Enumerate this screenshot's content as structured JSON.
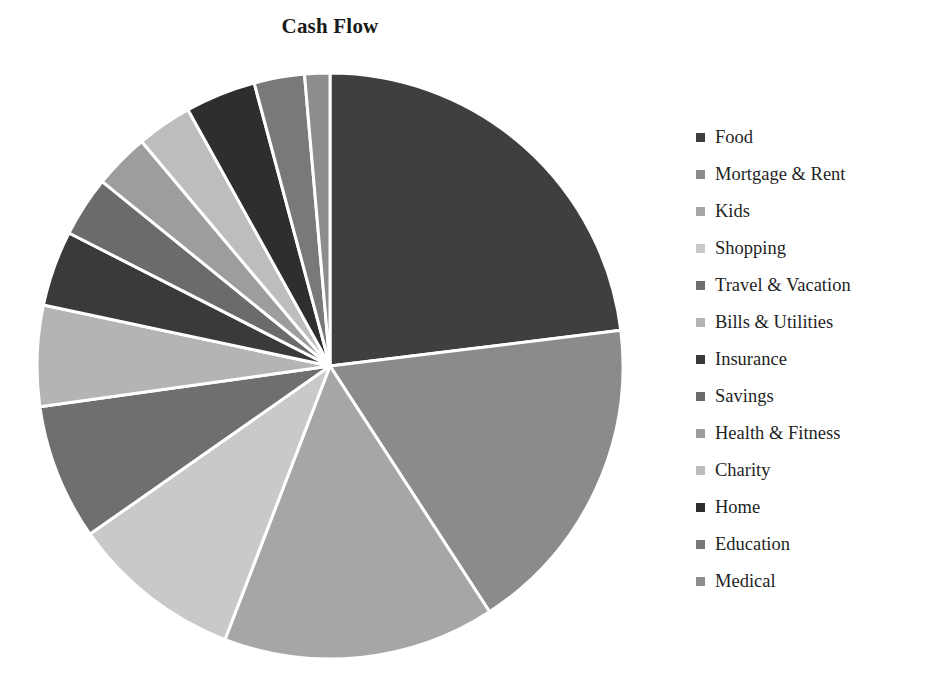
{
  "chart_data": {
    "type": "pie",
    "title": "Cash Flow",
    "xlabel": "",
    "ylabel": "",
    "legend_position": "right",
    "grid": false,
    "start_angle_deg": 0,
    "direction": "clockwise",
    "categories": [
      "Food",
      "Mortgage & Rent",
      "Kids",
      "Shopping",
      "Travel & Vacation",
      "Bills & Utilities",
      "Insurance",
      "Savings",
      "Health & Fitness",
      "Charity",
      "Home",
      "Education",
      "Medical"
    ],
    "values": [
      23.1,
      17.8,
      15.0,
      9.4,
      7.5,
      5.6,
      4.2,
      3.3,
      3.0,
      3.0,
      3.9,
      2.8,
      1.4
    ],
    "unit": "percent",
    "slice_colors": [
      "#3f3f3f",
      "#8b8b8b",
      "#a6a6a6",
      "#c9c9c9",
      "#6f6f6f",
      "#b4b4b4",
      "#3a3a3a",
      "#6b6b6b",
      "#9d9d9d",
      "#bdbdbd",
      "#2e2e2e",
      "#797979",
      "#8d8d8d"
    ],
    "slice_border_color": "#ffffff",
    "slices": [
      {
        "label": "Food",
        "value": 23.1,
        "color": "#3f3f3f",
        "start_deg": 0,
        "end_deg": 83
      },
      {
        "label": "Mortgage & Rent",
        "value": 17.8,
        "color": "#8b8b8b",
        "start_deg": 83,
        "end_deg": 147
      },
      {
        "label": "Kids",
        "value": 15.0,
        "color": "#a6a6a6",
        "start_deg": 147,
        "end_deg": 201
      },
      {
        "label": "Shopping",
        "value": 9.4,
        "color": "#c9c9c9",
        "start_deg": 201,
        "end_deg": 235
      },
      {
        "label": "Travel & Vacation",
        "value": 7.5,
        "color": "#6f6f6f",
        "start_deg": 235,
        "end_deg": 262
      },
      {
        "label": "Bills & Utilities",
        "value": 5.6,
        "color": "#b4b4b4",
        "start_deg": 262,
        "end_deg": 282
      },
      {
        "label": "Insurance",
        "value": 4.2,
        "color": "#3a3a3a",
        "start_deg": 282,
        "end_deg": 297
      },
      {
        "label": "Savings",
        "value": 3.3,
        "color": "#6b6b6b",
        "start_deg": 297,
        "end_deg": 309
      },
      {
        "label": "Health & Fitness",
        "value": 3.0,
        "color": "#9d9d9d",
        "start_deg": 309,
        "end_deg": 320
      },
      {
        "label": "Charity",
        "value": 3.0,
        "color": "#bdbdbd",
        "start_deg": 320,
        "end_deg": 331
      },
      {
        "label": "Home",
        "value": 3.9,
        "color": "#2e2e2e",
        "start_deg": 331,
        "end_deg": 345
      },
      {
        "label": "Education",
        "value": 2.8,
        "color": "#797979",
        "start_deg": 345,
        "end_deg": 355
      },
      {
        "label": "Medical",
        "value": 1.4,
        "color": "#8d8d8d",
        "start_deg": 355,
        "end_deg": 360
      }
    ],
    "geometry": {
      "cx": 330,
      "cy": 366,
      "r": 293
    }
  },
  "legend": {
    "items": [
      {
        "label": "Food",
        "color": "#3f3f3f"
      },
      {
        "label": "Mortgage & Rent",
        "color": "#8b8b8b"
      },
      {
        "label": "Kids",
        "color": "#a6a6a6"
      },
      {
        "label": "Shopping",
        "color": "#c9c9c9"
      },
      {
        "label": "Travel & Vacation",
        "color": "#6f6f6f"
      },
      {
        "label": "Bills & Utilities",
        "color": "#b4b4b4"
      },
      {
        "label": "Insurance",
        "color": "#3a3a3a"
      },
      {
        "label": "Savings",
        "color": "#6b6b6b"
      },
      {
        "label": "Health & Fitness",
        "color": "#9d9d9d"
      },
      {
        "label": "Charity",
        "color": "#bdbdbd"
      },
      {
        "label": "Home",
        "color": "#2e2e2e"
      },
      {
        "label": "Education",
        "color": "#797979"
      },
      {
        "label": "Medical",
        "color": "#8d8d8d"
      }
    ]
  }
}
